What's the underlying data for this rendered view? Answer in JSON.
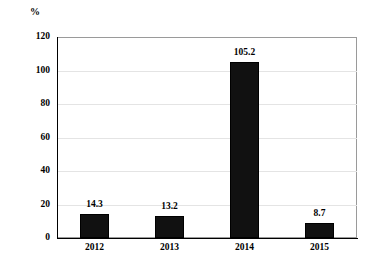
{
  "chart_data": {
    "type": "bar",
    "title": "",
    "subtitle": "",
    "xlabel": "",
    "ylabel": "%",
    "unit_label": "%",
    "categories": [
      "2012",
      "2013",
      "2014",
      "2015"
    ],
    "values": [
      14.3,
      13.2,
      105.2,
      8.7
    ],
    "value_labels": [
      "14.3",
      "13.2",
      "105.2",
      "8.7"
    ],
    "series": [
      {
        "name": "",
        "values": [
          14.3,
          13.2,
          105.2,
          8.7
        ]
      }
    ],
    "ylim": [
      0,
      120
    ],
    "ytick_values": [
      0,
      20,
      40,
      60,
      80,
      100,
      120
    ],
    "ytick_labels": [
      "0",
      "20",
      "40",
      "60",
      "80",
      "100",
      "120"
    ],
    "grid": true,
    "grid_axis": "y",
    "legend": false,
    "legend_position": "none",
    "bar_color": "#111111",
    "grid_color": "#e4e4e4",
    "axis_color": "#000000",
    "frame_color": "#9a9a9a",
    "background_color": "#ffffff"
  }
}
